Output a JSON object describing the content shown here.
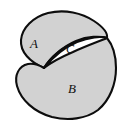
{
  "figure": {
    "kind": "set-diagram",
    "background_color": "#ffffff",
    "fill_color": "#d2d2d2",
    "intersection_fill_color": "#ffffff",
    "stroke_color": "#0d0d0d",
    "stroke_width": "2.1"
  },
  "regions": [
    {
      "id": "region-a",
      "label": "A",
      "label_x": 34,
      "label_y": 45,
      "role": "upper-left set"
    },
    {
      "id": "region-c",
      "label": "C",
      "label_x": 70,
      "label_y": 50,
      "role": "intersection lens"
    },
    {
      "id": "region-b",
      "label": "B",
      "label_x": 72,
      "label_y": 90,
      "role": "lower-right set"
    }
  ],
  "paths": {
    "blob_a": "M 44 68 C 30 62, 20 52, 21 40 C 22 28, 33 17, 48 13 C 65 9, 82 13, 94 21 C 103 27, 108 33, 107 38 C 100 36, 88 36, 76 41 C 62 47, 50 58, 44 68 Z",
    "blob_b": "M 44 68 C 51 57, 63 47, 77 42 C 89 37, 101 36, 107 38 C 112 44, 116 54, 116 68 C 116 84, 110 100, 98 110 C 86 119, 68 121, 52 117 C 34 112, 21 100, 17 86 C 14 75, 19 66, 28 64 C 34 63, 39 65, 44 68 Z",
    "lens_c": "M 44 68 C 52 58, 63 48, 77 42 C 89 37, 101 36, 107 38 C 100 41, 86 46, 73 52 C 59 58, 49 64, 44 68 Z"
  }
}
